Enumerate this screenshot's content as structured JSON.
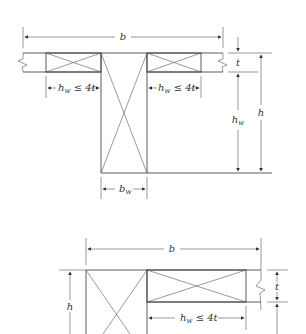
{
  "diagrams": [
    {
      "name": "t-beam-section",
      "labels": {
        "flange_width": "b",
        "flange_thickness": "t",
        "overhang_left": "h",
        "overhang_left_sub": "w",
        "overhang_left_rel": " ≤ 4t",
        "overhang_right": "h",
        "overhang_right_sub": "w",
        "overhang_right_rel": " ≤ 4t",
        "web_height": "h",
        "web_height_sub": "w",
        "total_height": "h",
        "web_width": "b",
        "web_width_sub": "w"
      }
    },
    {
      "name": "l-beam-section",
      "labels": {
        "flange_width": "b",
        "flange_thickness": "t",
        "overhang": "h",
        "overhang_sub": "w",
        "overhang_rel": " ≤ 4t",
        "total_height": "h"
      }
    }
  ],
  "colors": {
    "line": "#333333",
    "background": "#ffffff"
  }
}
